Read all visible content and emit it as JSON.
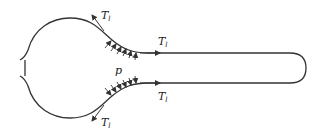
{
  "diagram": {
    "labels": {
      "tension_top_bulb": {
        "main": "T",
        "sub": "l"
      },
      "tension_top_tube": {
        "main": "T",
        "sub": "l"
      },
      "tension_bottom_tube": {
        "main": "T",
        "sub": "l"
      },
      "tension_bottom_bulb": {
        "main": "T",
        "sub": "l"
      },
      "pressure": "p"
    },
    "colors": {
      "stroke": "#333333",
      "background": "#ffffff"
    }
  }
}
